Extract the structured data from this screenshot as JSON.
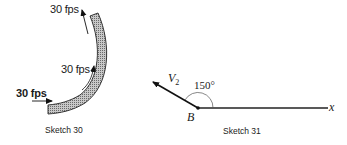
{
  "sketch30": {
    "caption": "Sketch 30",
    "labels": {
      "outlet_velocity": "30 fps",
      "mid_velocity": "30 fps",
      "inlet_velocity": "30 fps"
    },
    "pipe_fill": "#9a9a9a"
  },
  "sketch31": {
    "caption": "Sketch 31",
    "vector_label": "V",
    "vector_subscript": "2",
    "angle_label": "150°",
    "point_label": "B",
    "axis_label": "x"
  }
}
